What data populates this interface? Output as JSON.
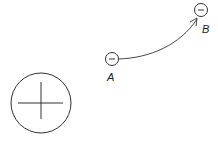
{
  "diagram": {
    "positive_charge": {
      "sign": "+",
      "icon": "plus-icon"
    },
    "point_a": {
      "label": "A",
      "sign": "−",
      "icon": "minus-icon"
    },
    "point_b": {
      "label": "B",
      "sign": "−",
      "icon": "minus-icon"
    },
    "path": {
      "from": "A",
      "to": "B",
      "arrow": "arrowhead-at-B"
    },
    "stroke_color": "#333333"
  }
}
